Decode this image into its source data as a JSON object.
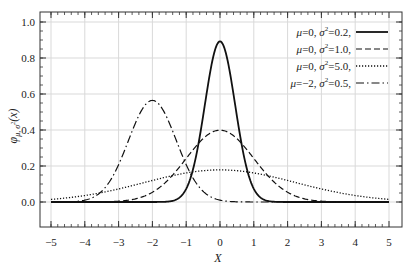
{
  "chart_data": {
    "type": "line",
    "title": "",
    "xlabel": "X",
    "ylabel": "φ_{μ,σ²}(x)",
    "xlim": [
      -5,
      5
    ],
    "ylim": [
      0,
      1.0
    ],
    "x_ticks": [
      -5,
      -4,
      -3,
      -2,
      -1,
      0,
      1,
      2,
      3,
      4,
      5
    ],
    "y_ticks": [
      "0.0",
      "0.2",
      "0.4",
      "0.6",
      "0.8",
      "1.0"
    ],
    "grid": true,
    "legend_position": "upper right",
    "series": [
      {
        "name": "μ=0, σ²=0.2,",
        "mu": 0,
        "variance": 0.2,
        "style": "solid",
        "peak": 0.892
      },
      {
        "name": "μ=0, σ²=1.0,",
        "mu": 0,
        "variance": 1.0,
        "style": "dashed",
        "peak": 0.399
      },
      {
        "name": "μ=0, σ²=5.0,",
        "mu": 0,
        "variance": 5.0,
        "style": "dotted",
        "peak": 0.178
      },
      {
        "name": "μ=−2, σ²=0.5,",
        "mu": -2,
        "variance": 0.5,
        "style": "dash-dot",
        "peak": 0.564
      }
    ],
    "x": [
      -5,
      -4,
      -3,
      -2.5,
      -2,
      -1.5,
      -1,
      -0.5,
      0,
      0.5,
      1,
      1.5,
      2,
      3,
      4,
      5
    ],
    "values": {
      "mu0_var0.2": [
        0.0,
        0.0,
        0.0,
        0.0,
        0.0,
        0.003,
        0.073,
        0.478,
        0.892,
        0.478,
        0.073,
        0.003,
        0.0,
        0.0,
        0.0,
        0.0
      ],
      "mu0_var1.0": [
        0.0,
        0.0001,
        0.004,
        0.018,
        0.054,
        0.13,
        0.242,
        0.352,
        0.399,
        0.352,
        0.242,
        0.13,
        0.054,
        0.004,
        0.0001,
        0.0
      ],
      "mu0_var5.0": [
        0.015,
        0.036,
        0.073,
        0.095,
        0.12,
        0.142,
        0.161,
        0.174,
        0.178,
        0.174,
        0.161,
        0.142,
        0.12,
        0.073,
        0.036,
        0.015
      ],
      "mu-2_var0.5": [
        0.0001,
        0.01,
        0.208,
        0.439,
        0.564,
        0.439,
        0.208,
        0.06,
        0.01,
        0.001,
        0.0,
        0.0,
        0.0,
        0.0,
        0.0,
        0.0
      ]
    }
  },
  "style": {
    "line_color": "#111111",
    "grid_color": "#d9d9d9",
    "frame_color": "#333333"
  }
}
